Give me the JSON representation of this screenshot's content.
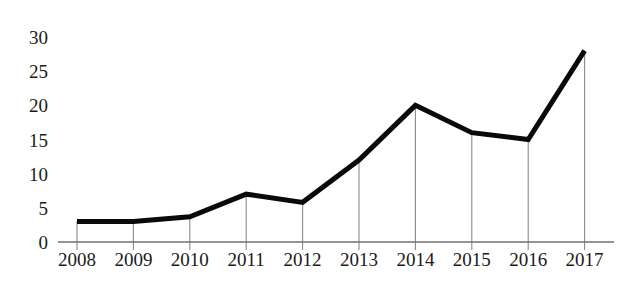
{
  "chart_data": {
    "type": "line",
    "title": "",
    "subtitle": "",
    "xlabel": "",
    "ylabel": "",
    "categories": [
      "2008",
      "2009",
      "2010",
      "2011",
      "2012",
      "2013",
      "2014",
      "2015",
      "2016",
      "2017"
    ],
    "values": [
      3,
      3,
      3.7,
      7,
      5.8,
      12,
      20,
      16,
      15,
      28
    ],
    "series": [
      {
        "name": "",
        "values": [
          3,
          3,
          3.7,
          7,
          5.8,
          12,
          20,
          16,
          15,
          28
        ]
      }
    ],
    "ylim": [
      0,
      30
    ],
    "yticks": [
      0,
      5,
      10,
      15,
      20,
      25,
      30
    ],
    "ytick_labels": [
      "0",
      "5",
      "10",
      "15",
      "20",
      "25",
      "30"
    ],
    "xtick_labels": [
      "2008",
      "2009",
      "2010",
      "2011",
      "2012",
      "2013",
      "2014",
      "2015",
      "2016",
      "2017"
    ],
    "grid": "vertical-droplines-only",
    "legend": "none",
    "annotations": [],
    "line_color": "#0a0a0a",
    "grid_color": "#8a8a8a",
    "axis_color": "#707070",
    "background_color": "#ffffff"
  }
}
